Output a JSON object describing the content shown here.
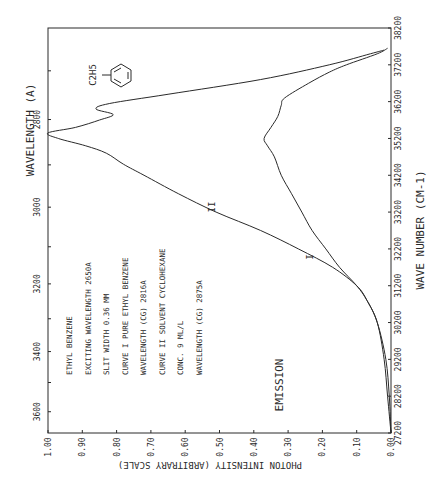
{
  "chart_data": {
    "type": "line",
    "orientation": "rotated-90",
    "title": "",
    "xlabel": "WAVE NUMBER (CM-1)",
    "x2label": "WAVELENGTH (A)",
    "ylabel": "PHOTON INTENSITY (ARBITRARY SCALE)",
    "xlim": [
      27200,
      38200
    ],
    "ylim": [
      0.0,
      1.0
    ],
    "x_ticks": [
      "27200",
      "28200",
      "29200",
      "30200",
      "31200",
      "32200",
      "33200",
      "34200",
      "35200",
      "36200",
      "37200",
      "38200"
    ],
    "x2_ticks": [
      "2800",
      "3000",
      "3200",
      "3400",
      "3600"
    ],
    "y_ticks": [
      "0.00",
      "0.10",
      "0.20",
      "0.30",
      "0.40",
      "0.50",
      "0.60",
      "0.70",
      "0.80",
      "0.90",
      "1.00"
    ],
    "series": [
      {
        "name": "Curve I (pure ethyl benzene)",
        "label": "I",
        "points": [
          [
            27200,
            0.0
          ],
          [
            28200,
            0.01
          ],
          [
            29200,
            0.02
          ],
          [
            30200,
            0.04
          ],
          [
            30800,
            0.07
          ],
          [
            31200,
            0.1
          ],
          [
            31700,
            0.15
          ],
          [
            32200,
            0.19
          ],
          [
            32700,
            0.23
          ],
          [
            33200,
            0.26
          ],
          [
            33700,
            0.29
          ],
          [
            34200,
            0.32
          ],
          [
            34700,
            0.34
          ],
          [
            35000,
            0.36
          ],
          [
            35200,
            0.37
          ],
          [
            35500,
            0.35
          ],
          [
            35800,
            0.33
          ],
          [
            36100,
            0.32
          ],
          [
            36300,
            0.31
          ],
          [
            36700,
            0.24
          ],
          [
            37000,
            0.18
          ],
          [
            37200,
            0.13
          ],
          [
            37500,
            0.04
          ],
          [
            37650,
            0.01
          ]
        ]
      },
      {
        "name": "Curve II (solvent cyclohexane)",
        "label": "II",
        "points": [
          [
            27200,
            0.0
          ],
          [
            28200,
            0.005
          ],
          [
            29200,
            0.015
          ],
          [
            30200,
            0.04
          ],
          [
            30800,
            0.07
          ],
          [
            31200,
            0.1
          ],
          [
            31700,
            0.17
          ],
          [
            32200,
            0.27
          ],
          [
            32700,
            0.38
          ],
          [
            33200,
            0.51
          ],
          [
            33700,
            0.62
          ],
          [
            34200,
            0.72
          ],
          [
            34500,
            0.78
          ],
          [
            34800,
            0.83
          ],
          [
            35000,
            0.89
          ],
          [
            35200,
            0.97
          ],
          [
            35350,
            1.0
          ],
          [
            35500,
            0.92
          ],
          [
            35700,
            0.85
          ],
          [
            35850,
            0.81
          ],
          [
            36000,
            0.86
          ],
          [
            36150,
            0.82
          ],
          [
            36400,
            0.65
          ],
          [
            36800,
            0.38
          ],
          [
            37200,
            0.18
          ],
          [
            37500,
            0.06
          ],
          [
            37600,
            0.02
          ]
        ]
      }
    ],
    "annotations": {
      "legend_lines": [
        "ETHYL BENZENE",
        "EXCITING WAVELENGTH  2650A",
        "SLIT WIDTH  0.36 MM",
        "CURVE I  PURE ETHYL BENZENE",
        "WAVELENGTH (CG)  2816A",
        "CURVE II  SOLVENT CYCLOHEXANE",
        "CONC.  9 ML/L",
        "WAVELENGTH (CG)  2875A"
      ],
      "mode_label": "EMISSION",
      "molecule_label": "C2H5",
      "curve_labels": [
        "I",
        "II"
      ]
    }
  }
}
